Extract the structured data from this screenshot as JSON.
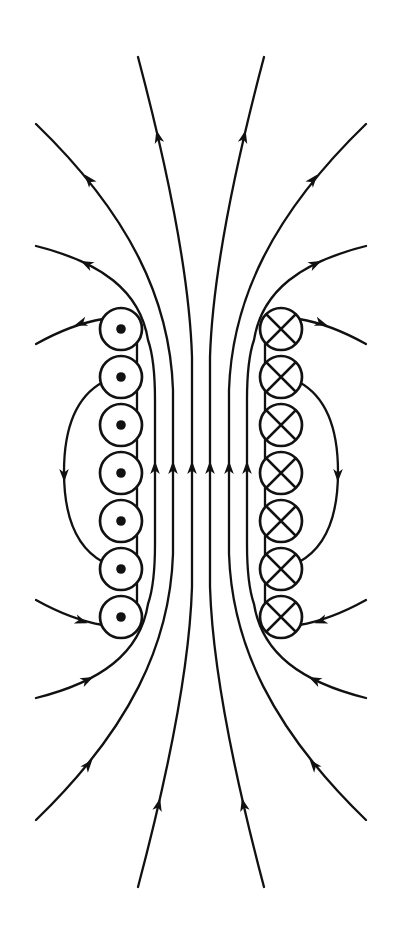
{
  "canvas": {
    "width": 401,
    "height": 939
  },
  "colors": {
    "ink": "#111111",
    "background": "#ffffff"
  },
  "figure": {
    "symmetry_axis_x": 201,
    "symmetry_axis_y": 472
  },
  "conductors": {
    "radius": 21,
    "dot_radius": 4.8,
    "stroke_width": 2.7,
    "left": {
      "symbol": "dot",
      "x": 121,
      "ys": [
        329,
        377,
        425,
        473,
        521,
        569,
        617
      ]
    },
    "right": {
      "symbol": "cross",
      "x": 281,
      "ys": [
        329,
        377,
        425,
        473,
        521,
        569,
        617
      ]
    }
  },
  "coil_spines": [
    {
      "name": "coil-spine-left",
      "x": 137,
      "y1": 329,
      "y2": 617
    },
    {
      "name": "coil-spine-right",
      "x": 265,
      "y1": 329,
      "y2": 617
    }
  ],
  "arrowhead": {
    "path": "M0,0 L-13,-4.8 L-9.5,0 L-13,4.8 Z"
  },
  "field_lines": [
    {
      "name": "field-line-center-left",
      "d": "M138,57 C160,140 189,260 192,357 L192,587 C189,684 160,804 138,887",
      "arrows": [
        [
          156.4,
          130.2,
          -103.5
        ],
        [
          192,
          461,
          -90
        ],
        [
          160.1,
          798.2,
          -76.5
        ]
      ]
    },
    {
      "name": "field-line-center-right",
      "d": "M264,57 C242,140 213,260 210,357 L210,587 C213,684 242,804 264,887",
      "arrows": [
        [
          245.6,
          130.2,
          -76.5
        ],
        [
          210,
          461,
          -90
        ],
        [
          241.9,
          798.2,
          -103.5
        ]
      ]
    },
    {
      "name": "field-line-middle-left",
      "d": "M36,124 C130,215 170,300 173,390 L173,554 C170,644 130,729 36,820",
      "arrows": [
        [
          84.6,
          174.6,
          -129.4
        ],
        [
          173,
          461,
          -90
        ],
        [
          92.4,
          759.6,
          -50.6
        ]
      ]
    },
    {
      "name": "field-line-middle-right",
      "d": "M366,124 C272,215 232,300 229,390 L229,554 C232,644 272,729 366,820",
      "arrows": [
        [
          317.4,
          174.6,
          -50.6
        ],
        [
          229,
          461,
          -90
        ],
        [
          309.6,
          759.6,
          -129.4
        ]
      ]
    },
    {
      "name": "field-line-inner-left",
      "d": "M36,246 C100,262 140,290 148,340 Q155,360 155,400 L155,544 Q155,584 148,604 C140,654 100,682 36,698",
      "arrows": [
        [
          80.7,
          260.9,
          -153.8
        ],
        [
          155,
          461,
          -90
        ],
        [
          93.3,
          676.9,
          -26.2
        ]
      ]
    },
    {
      "name": "field-line-inner-right",
      "d": "M366,246 C302,262 262,290 254,340 Q247,360 247,400 L247,544 Q247,584 254,604 C262,654 302,682 366,698",
      "arrows": [
        [
          321.3,
          260.9,
          -26.2
        ],
        [
          247,
          461,
          -90
        ],
        [
          308.7,
          676.9,
          -153.8
        ]
      ]
    },
    {
      "name": "return-loop-left",
      "d": "M103,382 C70,400 64,440 64,472 C64,504 70,544 103,562",
      "arrows": [
        [
          64.2,
          482,
          89
        ]
      ]
    },
    {
      "name": "return-loop-right",
      "d": "M299,382 C332,400 338,440 338,472 C338,504 332,544 299,562",
      "arrows": [
        [
          337.8,
          482,
          91
        ]
      ]
    },
    {
      "name": "stub-top-left",
      "d": "M36,344 Q72,324 103,319",
      "arrows": [
        [
          74.4,
          325.5,
          161
        ]
      ]
    },
    {
      "name": "stub-top-right",
      "d": "M366,344 Q330,324 299,319",
      "arrows": [
        [
          327.6,
          325.5,
          19
        ]
      ]
    },
    {
      "name": "stub-bottom-left",
      "d": "M36,600 Q72,620 103,625",
      "arrows": [
        [
          87.6,
          623.3,
          19
        ]
      ]
    },
    {
      "name": "stub-bottom-right",
      "d": "M366,600 Q330,620 299,625",
      "arrows": [
        [
          314.4,
          623.3,
          161
        ]
      ]
    }
  ]
}
